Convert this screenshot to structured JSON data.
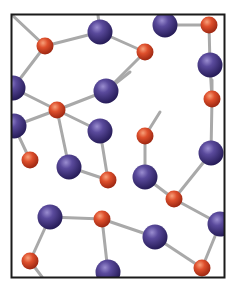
{
  "diagram": {
    "type": "ball-and-stick molecular structure",
    "frame": {
      "x": 11,
      "y": 14,
      "width": 214,
      "height": 264,
      "stroke": "#1a1a1a"
    },
    "colors": {
      "large_atom": "#4b3a8c",
      "large_atom_highlight": "#8a7cc4",
      "large_atom_shadow": "#2a1f5c",
      "small_atom": "#d9482a",
      "small_atom_highlight": "#f5946e",
      "small_atom_shadow": "#a32a14",
      "bond": "#a9a9a9"
    },
    "large_atoms": [
      {
        "id": "P1",
        "x": 100,
        "y": 32
      },
      {
        "id": "P2",
        "x": 165,
        "y": 25
      },
      {
        "id": "P3",
        "x": 210,
        "y": 65
      },
      {
        "id": "P4",
        "x": 13,
        "y": 88
      },
      {
        "id": "P5",
        "x": 106,
        "y": 91
      },
      {
        "id": "P6",
        "x": 14,
        "y": 126
      },
      {
        "id": "P7",
        "x": 100,
        "y": 131
      },
      {
        "id": "P8",
        "x": 69,
        "y": 167
      },
      {
        "id": "P9",
        "x": 145,
        "y": 177
      },
      {
        "id": "P10",
        "x": 211,
        "y": 153
      },
      {
        "id": "P11",
        "x": 50,
        "y": 217
      },
      {
        "id": "P12",
        "x": 155,
        "y": 237
      },
      {
        "id": "P13",
        "x": 220,
        "y": 224
      },
      {
        "id": "P14",
        "x": 108,
        "y": 272
      }
    ],
    "small_atoms": [
      {
        "id": "O1",
        "x": 45,
        "y": 46
      },
      {
        "id": "O2",
        "x": 145,
        "y": 52
      },
      {
        "id": "O3",
        "x": 209,
        "y": 25
      },
      {
        "id": "O4",
        "x": 57,
        "y": 110
      },
      {
        "id": "O5",
        "x": 212,
        "y": 99
      },
      {
        "id": "O6",
        "x": 145,
        "y": 136
      },
      {
        "id": "O7",
        "x": 30,
        "y": 160
      },
      {
        "id": "O8",
        "x": 108,
        "y": 180
      },
      {
        "id": "O9",
        "x": 174,
        "y": 199
      },
      {
        "id": "O10",
        "x": 102,
        "y": 219
      },
      {
        "id": "O11",
        "x": 30,
        "y": 261
      },
      {
        "id": "O12",
        "x": 202,
        "y": 268
      }
    ],
    "bonds": [
      [
        "O1",
        "EDGE_TL"
      ],
      [
        "O1",
        "P1"
      ],
      [
        "O1",
        "P4"
      ],
      [
        "P1",
        "EDGE_T1"
      ],
      [
        "P1",
        "O2"
      ],
      [
        "O2",
        "P5"
      ],
      [
        "P2",
        "O3"
      ],
      [
        "O3",
        "P3"
      ],
      [
        "P3",
        "O5"
      ],
      [
        "O5",
        "P10"
      ],
      [
        "O5",
        "EDGE_R1"
      ],
      [
        "P4",
        "O4"
      ],
      [
        "O4",
        "P6"
      ],
      [
        "O4",
        "P5"
      ],
      [
        "O4",
        "P7"
      ],
      [
        "O4",
        "P8"
      ],
      [
        "P6",
        "O7"
      ],
      [
        "P7",
        "O8"
      ],
      [
        "P8",
        "O8"
      ],
      [
        "P5",
        "EDGE_R2"
      ],
      [
        "O6",
        "P9"
      ],
      [
        "O6",
        "EDGE_O6"
      ],
      [
        "P9",
        "O9"
      ],
      [
        "O9",
        "P10"
      ],
      [
        "O9",
        "P13"
      ],
      [
        "P11",
        "O10"
      ],
      [
        "P11",
        "O11"
      ],
      [
        "O10",
        "P12"
      ],
      [
        "O10",
        "P14"
      ],
      [
        "P12",
        "O12"
      ],
      [
        "O12",
        "P13"
      ],
      [
        "O11",
        "EDGE_B1"
      ]
    ],
    "edge_points": {
      "EDGE_TL": {
        "x": 12,
        "y": 15
      },
      "EDGE_T1": {
        "x": 98,
        "y": 15
      },
      "EDGE_R1": {
        "x": 212,
        "y": 80
      },
      "EDGE_R2": {
        "x": 130,
        "y": 72
      },
      "EDGE_O6": {
        "x": 160,
        "y": 112
      },
      "EDGE_B1": {
        "x": 42,
        "y": 277
      }
    }
  }
}
